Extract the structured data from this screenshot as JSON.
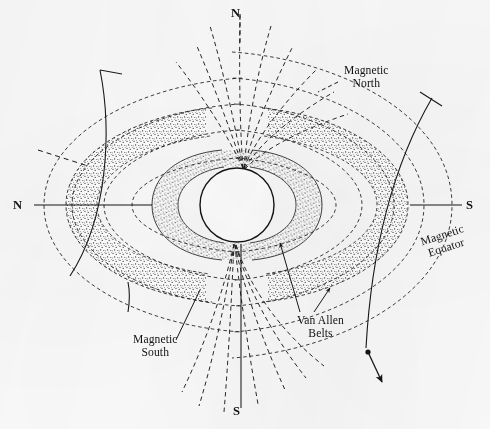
{
  "figure": {
    "background_color": "#fbfbfb",
    "ink_color": "#1a1a1a",
    "stipple_color": "#2b2b2b"
  },
  "axis_labels": {
    "geographic_north_top": "N",
    "geographic_south_bottom": "S",
    "geographic_north_left": "N",
    "geographic_south_right": "S"
  },
  "annotations": {
    "magnetic_north": {
      "line1": "Magnetic",
      "line2": "North"
    },
    "magnetic_south": {
      "line1": "Magnetic",
      "line2": "South"
    },
    "magnetic_equator": {
      "line1": "Magnetic",
      "line2": "Equator"
    },
    "van_allen_belts": {
      "line1": "Van Allen",
      "line2": "Belts"
    }
  },
  "diagram_data": {
    "type": "schematic-diagram",
    "subject": "geomagnetic dipole field and trapped-radiation belts",
    "earth": {
      "shape": "circle",
      "center_x": 237,
      "center_y": 205,
      "radius": 37,
      "fill": "white",
      "stroke": "#1a1a1a"
    },
    "belts": [
      {
        "name": "inner Van Allen belt",
        "render": "stippled torus cross-section",
        "pointer_from": "van-allen-belts-label"
      },
      {
        "name": "outer Van Allen belt",
        "render": "stippled torus cross-section",
        "pointer_from": "van-allen-belts-label"
      }
    ],
    "field_lines": {
      "style": "dashed",
      "count_per_hemisphere": 8,
      "converge_at": "magnetic poles",
      "closed_loops": 5
    },
    "magnetic_axis": {
      "tilt_description": "magnetic axis tilted relative to geographic rotation axis",
      "geographic_axis_style": "solid",
      "magnetic_axis_style": "dashed"
    },
    "magnetic_equator_trace": {
      "style": "solid curve with arrowhead",
      "arrowhead_at": "lower right",
      "marker_dot": true
    }
  }
}
